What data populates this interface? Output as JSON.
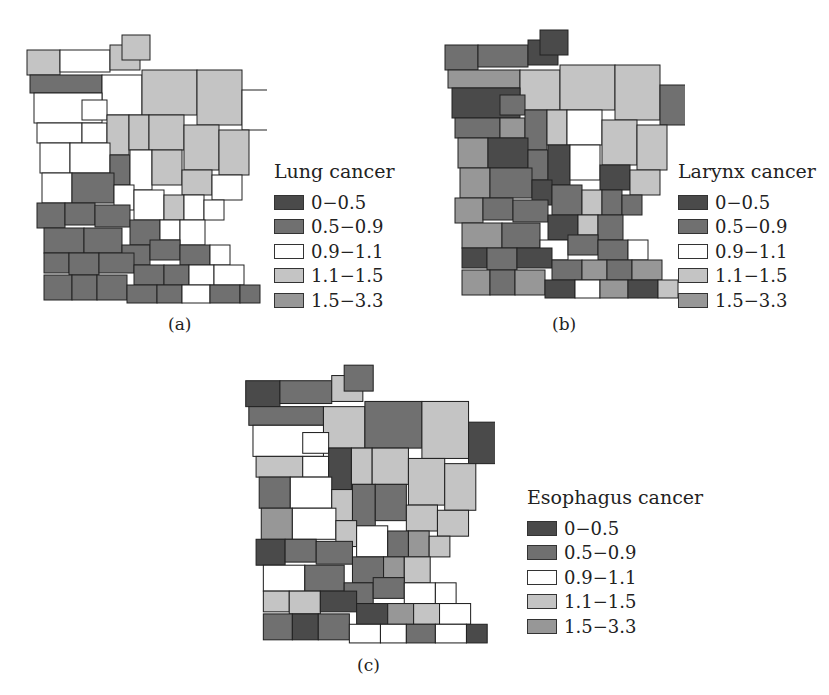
{
  "figure": {
    "classes": [
      {
        "range": "0−0.5",
        "color": "#4a4a4a"
      },
      {
        "range": "0.5−0.9",
        "color": "#707070"
      },
      {
        "range": "0.9−1.1",
        "color": "#ffffff"
      },
      {
        "range": "1.1−1.5",
        "color": "#c4c4c4"
      },
      {
        "range": "1.5−3.3",
        "color": "#979797"
      }
    ],
    "panels": [
      {
        "id": "a",
        "title": "Lung cancer",
        "caption": "(a)"
      },
      {
        "id": "b",
        "title": "Larynx cancer",
        "caption": "(b)"
      },
      {
        "id": "c",
        "title": "Esophagus cancer",
        "caption": "(c)"
      }
    ]
  },
  "chart_data": {
    "type": "choropleth",
    "region": "Minnesota counties",
    "maps": [
      {
        "panel": "(a)",
        "title": "Lung cancer",
        "legend": [
          "0−0.5",
          "0.5−0.9",
          "0.9−1.1",
          "1.1−1.5",
          "1.5−3.3"
        ]
      },
      {
        "panel": "(b)",
        "title": "Larynx cancer",
        "legend": [
          "0−0.5",
          "0.5−0.9",
          "0.9−1.1",
          "1.1−1.5",
          "1.5−3.3"
        ]
      },
      {
        "panel": "(c)",
        "title": "Esophagus cancer",
        "legend": [
          "0−0.5",
          "0.5−0.9",
          "0.9−1.1",
          "1.1−1.5",
          "1.5−3.3"
        ]
      }
    ],
    "legend_position": "right"
  }
}
